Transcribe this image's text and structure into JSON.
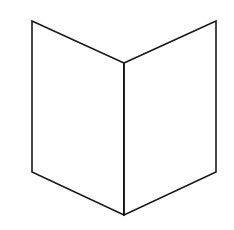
{
  "figure": {
    "stroke_color": "#1a1a1a",
    "stroke_width": 1.6,
    "fill_color": "#ffffff",
    "background": "#ffffff",
    "panels": {
      "left": {
        "points": [
          [
            32,
            21
          ],
          [
            124,
            63
          ],
          [
            124,
            215
          ],
          [
            32,
            172
          ]
        ]
      },
      "right": {
        "points": [
          [
            124,
            63
          ],
          [
            216,
            21
          ],
          [
            216,
            172
          ],
          [
            124,
            215
          ]
        ]
      }
    },
    "spine": {
      "x1": 124,
      "y1": 63,
      "x2": 124,
      "y2": 215
    }
  }
}
